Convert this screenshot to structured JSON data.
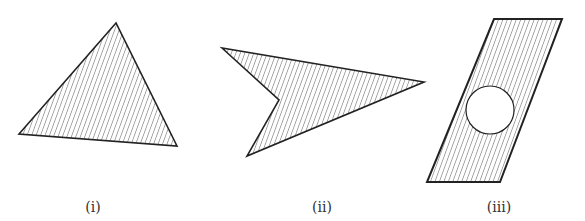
{
  "figures": [
    {
      "id": "i",
      "label": "(i)",
      "shape": "triangle",
      "points": "116,23 19,134 177,146",
      "label_x": 93,
      "label_y": 212
    },
    {
      "id": "ii",
      "label": "(ii)",
      "shape": "concave quadrilateral (arrowhead)",
      "points": "222,48 279,100 247,156 424,82",
      "label_x": 322,
      "label_y": 212
    },
    {
      "id": "iii",
      "label": "(iii)",
      "shape": "parallelogram with circular hole",
      "points": "494,19 562,19 500,182 427,182",
      "hole": {
        "cx": 490,
        "cy": 110,
        "r": 24
      },
      "label_x": 499,
      "label_y": 212
    }
  ],
  "style": {
    "stroke": "#222222",
    "hatch_color": "#444444",
    "background": "#ffffff"
  }
}
